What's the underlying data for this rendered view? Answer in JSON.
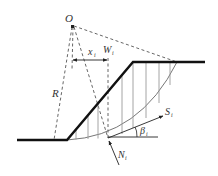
{
  "diagram": {
    "labels": {
      "center": "O",
      "radius": "R",
      "distance": "x",
      "distance_sub": "i",
      "weight": "W",
      "weight_sub": "i",
      "shear": "S",
      "shear_sub": "i",
      "normal": "N",
      "normal_sub": "i",
      "angle": "β",
      "angle_sub": "i"
    },
    "colors": {
      "ground": "#111111",
      "dashed": "#555555",
      "slices": "#9a9a9a",
      "arc": "#666666",
      "text": "#333333"
    }
  }
}
